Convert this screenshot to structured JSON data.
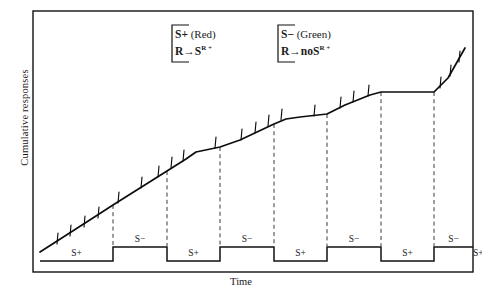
{
  "figure": {
    "y_axis_label": "Cumulative responses",
    "x_axis_label": "Time"
  },
  "legend": {
    "s_plus": {
      "name": "s-plus-legend",
      "line1_symbol": "S+",
      "line1_color_word": "(Red)",
      "line2_response": "R",
      "line2_arrow": "→",
      "line2_outcome": "S",
      "line2_outcome_sup": "R +"
    },
    "s_minus": {
      "name": "s-minus-legend",
      "line1_symbol": "S−",
      "line1_color_word": "(Green)",
      "line2_response": "R",
      "line2_arrow": "→",
      "line2_no": "no",
      "line2_outcome": "S",
      "line2_outcome_sup": "R +"
    }
  },
  "phases": [
    {
      "label": "S+",
      "state": "high",
      "x_start": 40,
      "x_end": 113
    },
    {
      "label": "S−",
      "state": "low",
      "x_start": 113,
      "x_end": 167
    },
    {
      "label": "S+",
      "state": "high",
      "x_start": 167,
      "x_end": 220
    },
    {
      "label": "S−",
      "state": "low",
      "x_start": 220,
      "x_end": 274
    },
    {
      "label": "S+",
      "state": "high",
      "x_start": 274,
      "x_end": 327
    },
    {
      "label": "S−",
      "state": "low",
      "x_start": 327,
      "x_end": 381
    },
    {
      "label": "S+",
      "state": "high",
      "x_start": 381,
      "x_end": 434
    },
    {
      "label": "S−",
      "state": "low",
      "x_start": 434,
      "x_end": 488
    },
    {
      "label": "S+",
      "state": "high",
      "x_start": 488,
      "x_end": 541
    }
  ],
  "chart_data": {
    "type": "line",
    "title": "",
    "xlabel": "Time",
    "ylabel": "Cumulative responses",
    "grid": false,
    "legend_position": "top-center",
    "axis_box": {
      "left": 33,
      "top": 11,
      "right": 473,
      "bottom": 272
    },
    "series": [
      {
        "name": "Cumulative responses",
        "points": [
          [
            40,
            252
          ],
          [
            68,
            234
          ],
          [
            96,
            216
          ],
          [
            113,
            205
          ],
          [
            140,
            188
          ],
          [
            167,
            171
          ],
          [
            186,
            159
          ],
          [
            196,
            152
          ],
          [
            220,
            147
          ],
          [
            240,
            140
          ],
          [
            274,
            124
          ],
          [
            286,
            119
          ],
          [
            300,
            117
          ],
          [
            327,
            114
          ],
          [
            345,
            105
          ],
          [
            370,
            95
          ],
          [
            381,
            92
          ],
          [
            395,
            92
          ],
          [
            420,
            92
          ],
          [
            434,
            92
          ],
          [
            448,
            78
          ],
          [
            465,
            48
          ]
        ]
      }
    ],
    "response_pips": [
      {
        "x": 57,
        "y": 244
      },
      {
        "x": 70,
        "y": 236
      },
      {
        "x": 84,
        "y": 227
      },
      {
        "x": 98,
        "y": 218
      },
      {
        "x": 118,
        "y": 203
      },
      {
        "x": 141,
        "y": 188
      },
      {
        "x": 158,
        "y": 177
      },
      {
        "x": 171,
        "y": 168
      },
      {
        "x": 183,
        "y": 161
      },
      {
        "x": 215,
        "y": 148
      },
      {
        "x": 241,
        "y": 140
      },
      {
        "x": 255,
        "y": 133
      },
      {
        "x": 268,
        "y": 126
      },
      {
        "x": 281,
        "y": 120
      },
      {
        "x": 314,
        "y": 116
      },
      {
        "x": 340,
        "y": 108
      },
      {
        "x": 353,
        "y": 102
      },
      {
        "x": 368,
        "y": 96
      },
      {
        "x": 440,
        "y": 88
      },
      {
        "x": 450,
        "y": 76
      },
      {
        "x": 459,
        "y": 62
      }
    ],
    "phase_boundaries_dashed": [
      113,
      167,
      220,
      274,
      327,
      381,
      434
    ],
    "square_wave": {
      "high_y": 247,
      "low_y": 261,
      "segment_edges": [
        40,
        113,
        167,
        220,
        274,
        327,
        381,
        434,
        473
      ],
      "starts_high": true
    }
  }
}
